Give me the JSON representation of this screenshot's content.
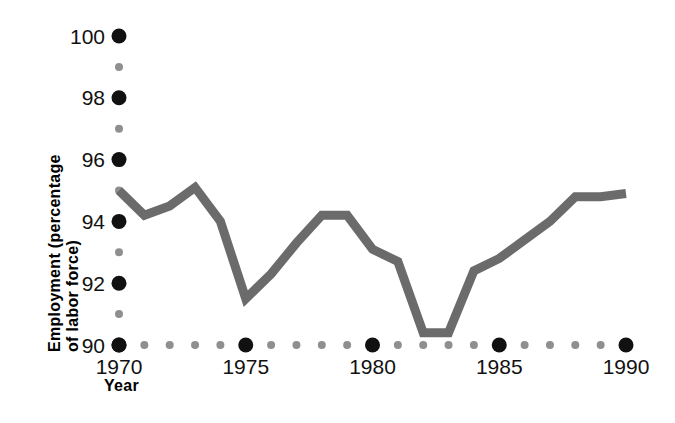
{
  "chart_data": {
    "type": "line",
    "title": "",
    "xlabel": "Year",
    "ylabel": "Employment (percentage of labor force)",
    "ylabel_line1": "Employment (percentage",
    "ylabel_line2": "of labor force)",
    "xlim": [
      1970,
      1990
    ],
    "ylim": [
      90,
      100
    ],
    "grid": false,
    "legend": "none",
    "line_color": "#6b6b6b",
    "major_tick_color": "#111111",
    "minor_tick_color": "#8f8f8f",
    "x": [
      1970,
      1971,
      1972,
      1973,
      1974,
      1975,
      1976,
      1977,
      1978,
      1979,
      1980,
      1981,
      1982,
      1983,
      1984,
      1985,
      1986,
      1987,
      1988,
      1989,
      1990
    ],
    "values": [
      95.0,
      94.2,
      94.5,
      95.1,
      94.0,
      91.5,
      92.3,
      93.3,
      94.2,
      94.2,
      93.1,
      92.7,
      90.4,
      90.4,
      92.4,
      92.8,
      93.4,
      94.0,
      94.8,
      94.8,
      94.9
    ],
    "series": [
      {
        "name": "Employment",
        "values": [
          95.0,
          94.2,
          94.5,
          95.1,
          94.0,
          91.5,
          92.3,
          93.3,
          94.2,
          94.2,
          93.1,
          92.7,
          90.4,
          90.4,
          92.4,
          92.8,
          93.4,
          94.0,
          94.8,
          94.8,
          94.9
        ]
      }
    ],
    "y_major_ticks": [
      100,
      98,
      96,
      94,
      92,
      90
    ],
    "y_major_labels": [
      "100",
      "98",
      "96",
      "94",
      "92",
      "90"
    ],
    "y_minor_ticks": [
      99,
      97,
      95,
      93,
      91
    ],
    "x_major_ticks": [
      1970,
      1975,
      1980,
      1985,
      1990
    ],
    "x_major_labels": [
      "1970",
      "1975",
      "1980",
      "1985",
      "1990"
    ],
    "x_minor_ticks": [
      1971,
      1972,
      1973,
      1974,
      1976,
      1977,
      1978,
      1979,
      1981,
      1982,
      1983,
      1984,
      1986,
      1987,
      1988,
      1989
    ]
  }
}
